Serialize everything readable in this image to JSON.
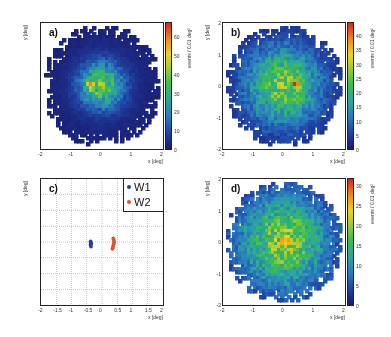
{
  "chart_data": [
    {
      "panel": "a)",
      "type": "heatmap",
      "title": "",
      "xlabel": "x [deg]",
      "ylabel": "y [deg]",
      "xlim": [
        -2,
        2
      ],
      "ylim": [
        -2,
        2
      ],
      "x_ticks": [
        "-2",
        "-1",
        "0",
        "1",
        "2"
      ],
      "y_ticks": [
        "-2",
        "-1",
        "0",
        "1",
        "2"
      ],
      "colorbar_label": "events / 0.01 deg²",
      "colorbar_range": [
        0,
        68
      ],
      "colorbar_ticks": [
        "0",
        "10",
        "20",
        "30",
        "40",
        "50",
        "60"
      ],
      "peak": {
        "x": -0.35,
        "y": 0.0,
        "value": 65
      },
      "spread_sigma": 0.35,
      "support_radius": 2.0
    },
    {
      "panel": "b)",
      "type": "heatmap",
      "xlabel": "x [deg]",
      "ylabel": "y [deg]",
      "xlim": [
        -2,
        2
      ],
      "ylim": [
        -2,
        2
      ],
      "x_ticks": [
        "-2",
        "-1",
        "0",
        "1",
        "2"
      ],
      "y_ticks": [
        "-2",
        "-1",
        "0",
        "1",
        "2"
      ],
      "colorbar_label": "events / 0.01 deg²",
      "colorbar_range": [
        0,
        45
      ],
      "colorbar_ticks": [
        "0",
        "5",
        "10",
        "15",
        "20",
        "25",
        "30",
        "35",
        "40"
      ],
      "peak": {
        "x": 0.4,
        "y": 0.05,
        "value": 43
      },
      "spread_sigma": 0.6,
      "support_radius": 2.0
    },
    {
      "panel": "c)",
      "type": "scatter",
      "xlabel": "x [deg]",
      "ylabel": "y [deg]",
      "xlim": [
        -2,
        2
      ],
      "ylim": [
        -2,
        2
      ],
      "x_ticks": [
        "-2",
        "-1.5",
        "-1",
        "-0.5",
        "0",
        "0.5",
        "1",
        "1.5",
        "2"
      ],
      "y_ticks": [
        "-2",
        "-1.5",
        "-1",
        "-0.5",
        "0",
        "0.5",
        "1",
        "1.5",
        "2"
      ],
      "grid": true,
      "legend_position": "top-right",
      "series": [
        {
          "name": "W1",
          "color": "#2b3f8f",
          "x": [
            -0.38,
            -0.37,
            -0.36,
            -0.38,
            -0.37,
            -0.36,
            -0.35,
            -0.37
          ],
          "y": [
            0.0,
            -0.03,
            -0.06,
            -0.09,
            -0.12,
            -0.15,
            -0.05,
            0.02
          ]
        },
        {
          "name": "W2",
          "color": "#e0502a",
          "x": [
            0.37,
            0.38,
            0.39,
            0.4,
            0.39,
            0.38,
            0.37,
            0.36,
            0.35,
            0.34
          ],
          "y": [
            0.12,
            0.08,
            0.04,
            0.0,
            -0.04,
            -0.08,
            -0.12,
            -0.16,
            -0.2,
            -0.22
          ]
        }
      ]
    },
    {
      "panel": "d)",
      "type": "heatmap",
      "xlabel": "x [deg]",
      "ylabel": "y [deg]",
      "xlim": [
        -2,
        2
      ],
      "ylim": [
        -2,
        2
      ],
      "x_ticks": [
        "-2",
        "-1",
        "0",
        "1",
        "2"
      ],
      "y_ticks": [
        "-2",
        "-1",
        "0",
        "1",
        "2"
      ],
      "colorbar_label": "events / 0.01 deg²",
      "colorbar_range": [
        0,
        32
      ],
      "colorbar_ticks": [
        "0",
        "5",
        "10",
        "15",
        "20",
        "25",
        "30"
      ],
      "peak": {
        "x": 0.05,
        "y": 0.0,
        "value": 31
      },
      "spread_sigma": 0.7,
      "support_radius": 2.0
    }
  ],
  "labels": {
    "a": "a)",
    "b": "b)",
    "c": "c)",
    "d": "d)",
    "xlabel": "x [deg]",
    "ylabel": "y [deg]",
    "cbar_title": "events / 0.01 deg²",
    "legend_w1": "W1",
    "legend_w2": "W2"
  },
  "colors": {
    "w1": "#2b3f8f",
    "w2": "#e0502a",
    "empty": "#ffffff",
    "low": "#1a1a6e"
  }
}
